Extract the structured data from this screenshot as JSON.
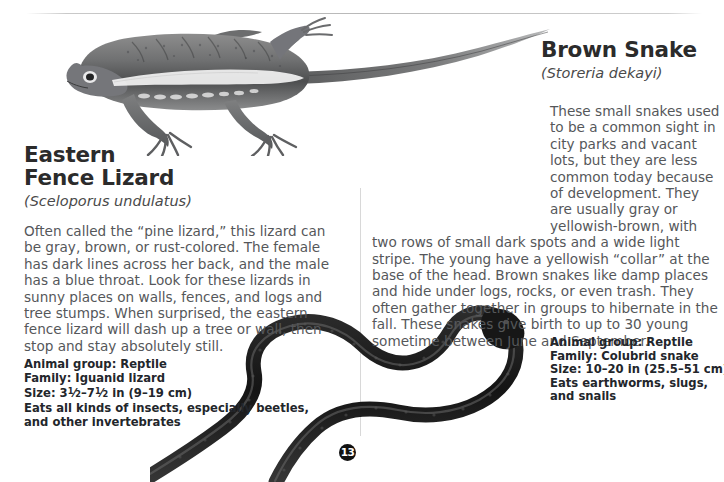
{
  "page": {
    "number": "13",
    "ink_color": "#55575a",
    "heading_color": "#2b2b2b",
    "badge_color": "#111111"
  },
  "entries": [
    {
      "id": "eastern-fence-lizard",
      "common_name_line1": "Eastern",
      "common_name_line2": "Fence Lizard",
      "scientific_name": "(Sceloporus undulatus)",
      "description": "Often called the “pine lizard,” this lizard can be gray, brown, or rust-colored. The female has dark lines across her back, and the male has a blue throat. Look for these lizards in sunny places on walls, fences, and logs and tree stumps. When surprised, the eastern fence lizard will dash up a tree or wall, then stop and stay absolutely still.",
      "facts": {
        "animal_group": "Animal group: Reptile",
        "family": "Family: Iguanid lizard",
        "size_prefix": "Size: 3",
        "size_frac1_num": "1",
        "size_frac1_den": "2",
        "size_mid": "–7",
        "size_frac2_num": "1",
        "size_frac2_den": "2",
        "size_suffix": " in (9–19 cm)",
        "diet_line1": "Eats all kinds of insects, especially beetles,",
        "diet_line2": "and other invertebrates"
      },
      "illustration": "eastern-fence-lizard-illustration"
    },
    {
      "id": "brown-snake",
      "common_name": "Brown Snake",
      "scientific_name": "(Storeria dekayi)",
      "description": "These small snakes used to be a common sight in city parks and vacant lots, but they are less common today because of development. They are usually gray or yellowish-brown, with two rows of small dark spots and a wide light stripe. The young have a yellowish “collar” at the base of the head. Brown snakes like damp places and hide under logs, rocks, or even trash. They often gather together in groups to hibernate in the fall. These snakes give birth to up to 30 young sometime between June and September.",
      "facts": {
        "animal_group": "Animal group: Reptile",
        "family": "Family: Colubrid snake",
        "size": "Size: 10–20 in (25.5–51 cm)",
        "diet_line1": "Eats earthworms, slugs,",
        "diet_line2": "and snails"
      },
      "illustration": "brown-snake-illustration"
    }
  ]
}
